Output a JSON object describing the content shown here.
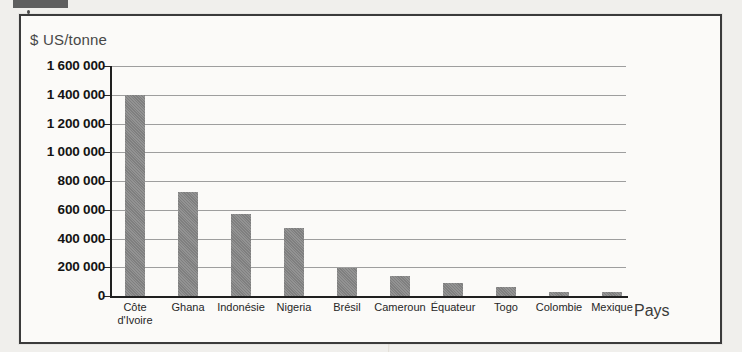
{
  "chart_data": {
    "type": "bar",
    "title": "$ US/tonne",
    "ylabel": "$ US/tonne",
    "xlabel": "Pays",
    "categories": [
      "Côte d'Ivoire",
      "Ghana",
      "Indonésie",
      "Nigeria",
      "Brésil",
      "Cameroun",
      "Équateur",
      "Togo",
      "Colombie",
      "Mexique"
    ],
    "values": [
      1400000,
      720000,
      570000,
      470000,
      195000,
      140000,
      90000,
      60000,
      25000,
      25000
    ],
    "ylim": [
      0,
      1600000
    ],
    "ytick_step": 200000,
    "ytick_labels": [
      "1 600 000",
      "1 400 000",
      "1 200 000",
      "1 000 000",
      "800 000",
      "600 000",
      "400 000",
      "200 000",
      "0"
    ],
    "grid": true,
    "legend": "none",
    "bar_color": "#878787",
    "axis_color": "#1f1f1f",
    "gridline_color": "#9e9e9e"
  }
}
